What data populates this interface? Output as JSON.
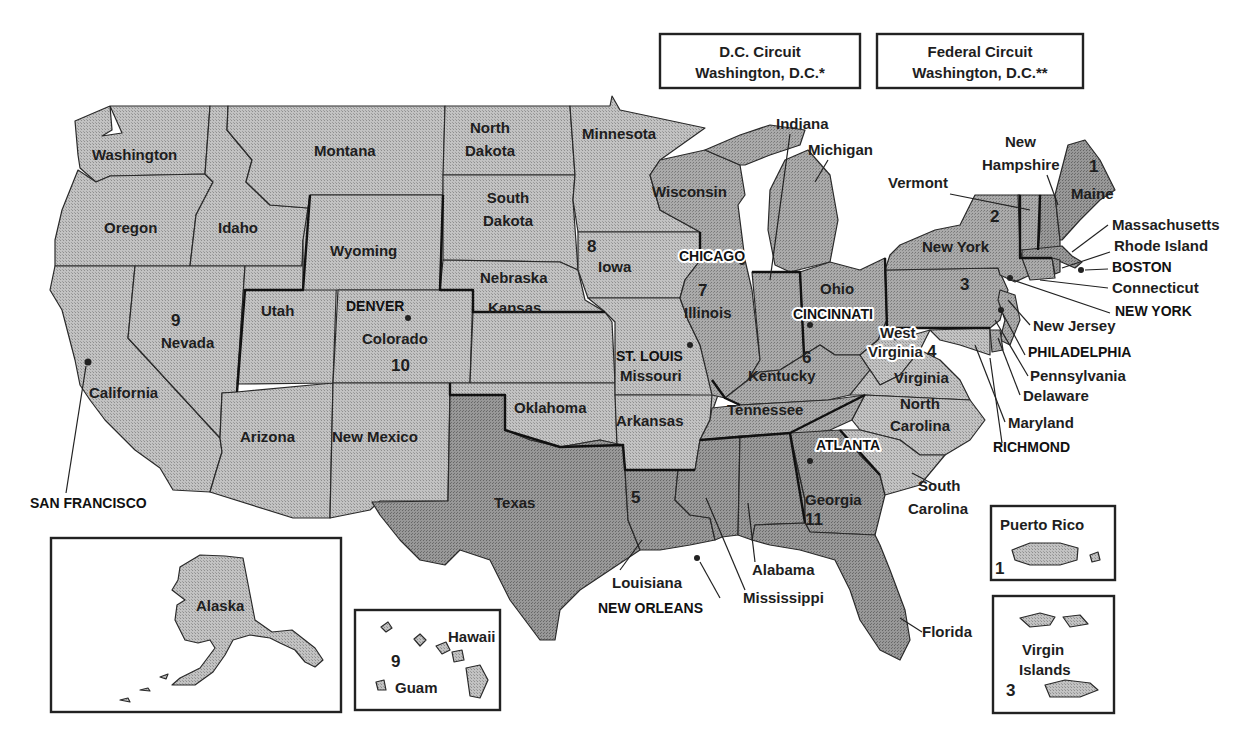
{
  "map": {
    "title_boxes": [
      {
        "line1": "D.C. Circuit",
        "line2": "Washington, D.C.*"
      },
      {
        "line1": "Federal Circuit",
        "line2": "Washington, D.C.**"
      }
    ],
    "colors": {
      "light_fill": "#b9b9b9",
      "mid_fill": "#a3a3a3",
      "dark_fill": "#8f8f8f",
      "boundary": "#222222",
      "background": "#ffffff"
    },
    "states": {
      "washington": "Washington",
      "oregon": "Oregon",
      "idaho": "Idaho",
      "montana": "Montana",
      "california": "California",
      "nevada": "Nevada",
      "arizona": "Arizona",
      "utah": "Utah",
      "wyoming": "Wyoming",
      "colorado": "Colorado",
      "new_mexico": "New Mexico",
      "north_dakota_1": "North",
      "north_dakota_2": "Dakota",
      "south_dakota_1": "South",
      "south_dakota_2": "Dakota",
      "nebraska": "Nebraska",
      "kansas": "Kansas",
      "oklahoma": "Oklahoma",
      "texas": "Texas",
      "minnesota": "Minnesota",
      "iowa": "Iowa",
      "missouri": "Missouri",
      "arkansas": "Arkansas",
      "louisiana": "Louisiana",
      "wisconsin": "Wisconsin",
      "illinois": "Illinois",
      "indiana": "Indiana",
      "michigan": "Michigan",
      "ohio": "Ohio",
      "kentucky": "Kentucky",
      "tennessee": "Tennessee",
      "mississippi": "Mississippi",
      "alabama": "Alabama",
      "georgia": "Georgia",
      "florida": "Florida",
      "south_carolina_1": "South",
      "south_carolina_2": "Carolina",
      "north_carolina_1": "North",
      "north_carolina_2": "Carolina",
      "virginia": "Virginia",
      "west_virginia_1": "West",
      "west_virginia_2": "Virginia",
      "maryland": "Maryland",
      "delaware": "Delaware",
      "pennsylvania": "Pennsylvania",
      "new_jersey": "New Jersey",
      "new_york": "New York",
      "vermont": "Vermont",
      "new_hampshire_1": "New",
      "new_hampshire_2": "Hampshire",
      "maine": "Maine",
      "massachusetts": "Massachusetts",
      "rhode_island": "Rhode Island",
      "connecticut": "Connecticut",
      "alaska": "Alaska",
      "hawaii": "Hawaii",
      "guam": "Guam",
      "puerto_rico": "Puerto Rico",
      "virgin_islands_1": "Virgin",
      "virgin_islands_2": "Islands"
    },
    "circuits": {
      "c1": "1",
      "c1_pr": "1",
      "c2": "2",
      "c3": "3",
      "c3_vi": "3",
      "c4": "4",
      "c5": "5",
      "c6": "6",
      "c7": "7",
      "c8": "8",
      "c9": "9",
      "c9_hi": "9",
      "c10": "10",
      "c11": "11"
    },
    "cities": {
      "boston": "BOSTON",
      "new_york": "NEW YORK",
      "philadelphia": "PHILADELPHIA",
      "richmond": "RICHMOND",
      "new_orleans": "NEW ORLEANS",
      "cincinnati": "CINCINNATI",
      "chicago": "CHICAGO",
      "st_louis": "ST. LOUIS",
      "denver": "DENVER",
      "san_francisco": "SAN FRANCISCO",
      "atlanta": "ATLANTA"
    }
  }
}
